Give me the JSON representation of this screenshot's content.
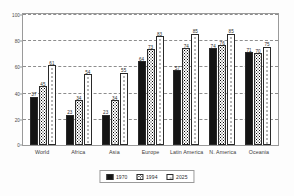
{
  "chart_data": {
    "type": "bar",
    "title": "",
    "xlabel": "",
    "ylabel": "",
    "ylim": [
      0,
      100
    ],
    "yticks": [
      0,
      20,
      40,
      60,
      80,
      100
    ],
    "grid": true,
    "legend_position": "bottom",
    "categories": [
      "World",
      "Africa",
      "Asia",
      "Europe",
      "Latin America",
      "N. America",
      "Oceania"
    ],
    "series": [
      {
        "name": "1970",
        "pattern": "solid-black",
        "values": [
          37,
          23,
          23,
          64,
          57,
          74,
          71
        ]
      },
      {
        "name": "1994",
        "pattern": "dense-dots",
        "values": [
          45,
          34,
          34,
          73,
          74,
          76,
          70
        ]
      },
      {
        "name": "2025",
        "pattern": "sparse-dots",
        "values": [
          61,
          54,
          55,
          83,
          85,
          85,
          75
        ]
      }
    ]
  },
  "axis": {
    "y_ticks": [
      "100",
      "80",
      "60",
      "40",
      "20",
      "0"
    ]
  },
  "legend": {
    "items": [
      {
        "label": "1970"
      },
      {
        "label": "1994"
      },
      {
        "label": "2025"
      }
    ]
  }
}
